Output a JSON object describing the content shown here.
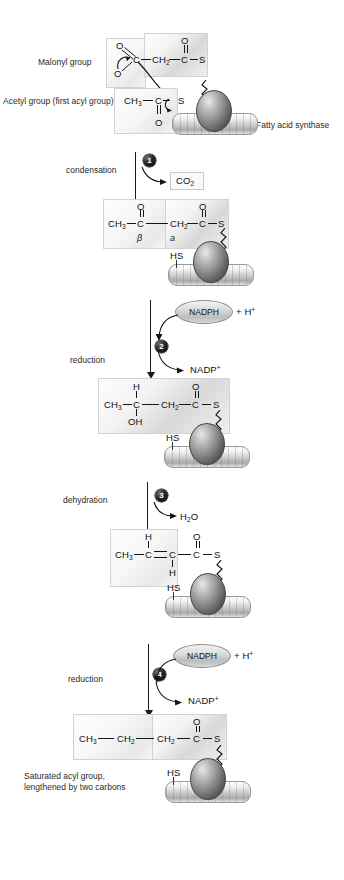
{
  "diagram": {
    "labels": {
      "malonyl_group": "Malonyl group",
      "acetyl_group": "Acetyl group (first acyl group)",
      "fatty_acid_synthase": "Fatty acid synthase",
      "final_caption_line1": "Saturated acyl group,",
      "final_caption_line2": "lengthened by two carbons",
      "hs": "HS"
    },
    "steps": [
      {
        "number": "1",
        "name": "condensation",
        "byproduct": "CO2",
        "byproduct_display": "CO",
        "byproduct_sub": "2"
      },
      {
        "number": "2",
        "name": "reduction",
        "cofactor_in": "NADPH",
        "cofactor_extra": "+ H",
        "cofactor_extra_sup": "+",
        "cofactor_out": "NADP",
        "cofactor_out_sup": "+"
      },
      {
        "number": "3",
        "name": "dehydration",
        "byproduct": "H2O",
        "byproduct_display": "H",
        "byproduct_sub": "2",
        "byproduct_tail": "O"
      },
      {
        "number": "4",
        "name": "reduction",
        "cofactor_in": "NADPH",
        "cofactor_extra": "+ H",
        "cofactor_extra_sup": "+",
        "cofactor_out": "NADP",
        "cofactor_out_sup": "+"
      }
    ],
    "molecules": {
      "malonyl": {
        "carboxyl_o_top": "O",
        "carboxyl_o_bottom": "O",
        "c1": "C",
        "ch2": "CH",
        "ch2_sub": "2",
        "c2": "C",
        "o_top": "O",
        "s": "S"
      },
      "acetyl": {
        "ch3": "CH",
        "ch3_sub": "3",
        "c": "C",
        "o": "O",
        "s": "S"
      },
      "ketoacyl": {
        "ch3": "CH",
        "ch3_sub": "3",
        "c_beta": "C",
        "o_beta": "O",
        "beta_label": "β",
        "ch2": "CH",
        "ch2_sub": "2",
        "c_alpha": "C",
        "o_alpha": "O",
        "alpha_label": "a",
        "s": "S"
      },
      "hydroxyacyl": {
        "ch3": "CH",
        "ch3_sub": "3",
        "c": "C",
        "h_top": "H",
        "oh": "OH",
        "ch2": "CH",
        "ch2_sub": "2",
        "c_carbonyl": "C",
        "o": "O",
        "s": "S"
      },
      "enoyl": {
        "ch3": "CH",
        "ch3_sub": "3",
        "c1": "C",
        "h_top": "H",
        "c2": "C",
        "h_bottom": "H",
        "c_carbonyl": "C",
        "o": "O",
        "s": "S"
      },
      "butyryl": {
        "ch3": "CH",
        "ch3_sub": "3",
        "ch2_a": "CH",
        "ch2_a_sub": "2",
        "ch2_b": "CH",
        "ch2_b_sub": "2",
        "c": "C",
        "o": "O",
        "s": "S"
      }
    },
    "colors": {
      "ink": "#1a1a1a",
      "box_border": "#d2d2d2",
      "badge": "#000000",
      "pill_fill": "#dcdcdc"
    }
  }
}
